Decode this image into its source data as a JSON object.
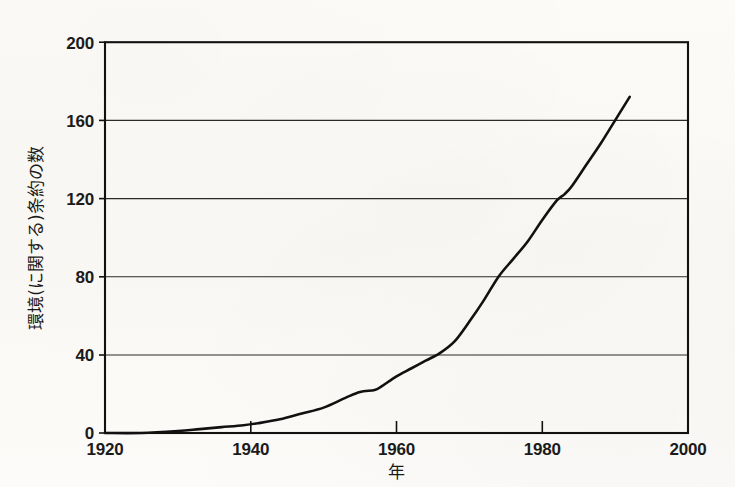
{
  "chart_data": {
    "type": "line",
    "title": "",
    "xlabel": "年",
    "ylabel": "環境(に関する)条約の数",
    "xlim": [
      1920,
      2000
    ],
    "ylim": [
      0,
      200
    ],
    "xticks": [
      1920,
      1940,
      1960,
      1980,
      2000
    ],
    "yticks": [
      0,
      40,
      80,
      120,
      160,
      200
    ],
    "xtick_labels": [
      "1920",
      "1940",
      "1960",
      "1980",
      "2000"
    ],
    "ytick_labels": [
      "0",
      "40",
      "80",
      "120",
      "160",
      "200"
    ],
    "grid": "horizontal",
    "legend": "none",
    "line_color": "#111111",
    "background_color": "#fbfaf7",
    "series": [
      {
        "name": "環境(に関する)条約の数",
        "x": [
          1920,
          1925,
          1930,
          1933,
          1936,
          1939,
          1941,
          1944,
          1947,
          1950,
          1953,
          1955,
          1957,
          1958,
          1960,
          1962,
          1964,
          1966,
          1968,
          1970,
          1972,
          1974,
          1976,
          1978,
          1980,
          1982,
          1983,
          1984,
          1986,
          1988,
          1990,
          1992
        ],
        "y": [
          0,
          0,
          1,
          2,
          3,
          4,
          5,
          7,
          10,
          13,
          18,
          21,
          22,
          24,
          29,
          33,
          37,
          41,
          47,
          57,
          68,
          80,
          89,
          98,
          109,
          119,
          122,
          126,
          137,
          148,
          160,
          172
        ]
      }
    ]
  },
  "axis": {
    "y_title": "環境(に関する)条約の数",
    "x_title": "年"
  }
}
